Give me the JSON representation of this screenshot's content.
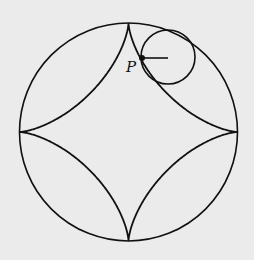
{
  "diagram": {
    "labels": {
      "point": "P"
    },
    "big_circle": {
      "cx": 128.5,
      "cy": 132,
      "r": 109
    },
    "small_circle": {
      "cx": 168,
      "cy": 57,
      "r": 27
    },
    "point_P": {
      "x": 142,
      "y": 58
    },
    "curve": "astroid",
    "colors": {
      "background": "#ebebeb",
      "stroke": "#111111"
    }
  }
}
